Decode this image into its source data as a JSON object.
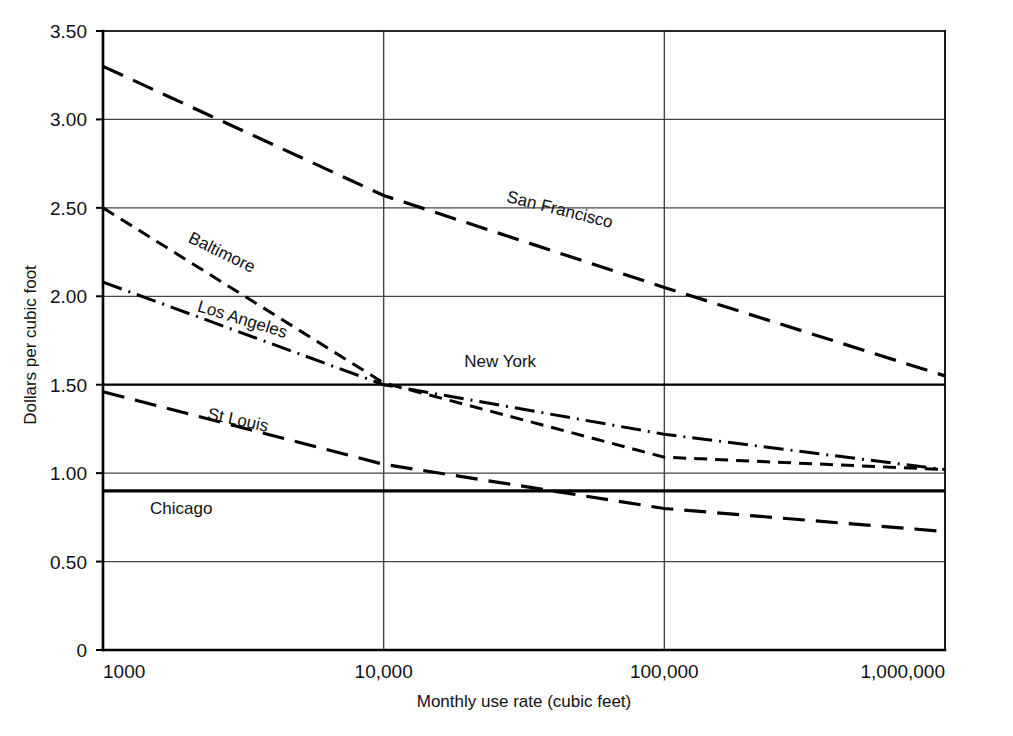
{
  "chart_data": {
    "type": "line",
    "title": "",
    "xlabel": "Monthly use rate (cubic feet)",
    "ylabel": "Dollars per cubic foot",
    "xscale": "log",
    "xlim": [
      1000,
      1000000
    ],
    "ylim": [
      0,
      3.5
    ],
    "grid": true,
    "legend_position": "inline-labels",
    "x_tick_labels": [
      "1000",
      "10,000",
      "100,000",
      "1,000,000"
    ],
    "x_tick_values": [
      1000,
      10000,
      100000,
      1000000
    ],
    "y_tick_labels": [
      "0",
      "0.50",
      "1.00",
      "1.50",
      "2.00",
      "2.50",
      "3.00",
      "3.50"
    ],
    "y_tick_values": [
      0,
      0.5,
      1.0,
      1.5,
      2.0,
      2.5,
      3.0,
      3.5
    ],
    "series": [
      {
        "name": "San Francisco",
        "style": "long-dash",
        "label_x": 42000,
        "label_y": 2.46,
        "label_rotation": 14,
        "points": [
          {
            "x": 1000,
            "y": 3.3
          },
          {
            "x": 10000,
            "y": 2.57
          },
          {
            "x": 100000,
            "y": 2.05
          },
          {
            "x": 1000000,
            "y": 1.55
          }
        ]
      },
      {
        "name": "Baltimore",
        "style": "dashed",
        "label_x": 2600,
        "label_y": 2.22,
        "label_rotation": 26,
        "points": [
          {
            "x": 1000,
            "y": 2.5
          },
          {
            "x": 10000,
            "y": 1.51
          },
          {
            "x": 100000,
            "y": 1.09
          },
          {
            "x": 1000000,
            "y": 1.02
          }
        ]
      },
      {
        "name": "Los Angeles",
        "style": "dash-dot",
        "label_x": 3100,
        "label_y": 1.84,
        "label_rotation": 17,
        "points": [
          {
            "x": 1000,
            "y": 2.08
          },
          {
            "x": 10000,
            "y": 1.5
          },
          {
            "x": 100000,
            "y": 1.22
          },
          {
            "x": 1000000,
            "y": 1.02
          }
        ]
      },
      {
        "name": "New York",
        "style": "solid",
        "label_x": 26000,
        "label_y": 1.6,
        "label_rotation": 0,
        "points": [
          {
            "x": 1000,
            "y": 1.5
          },
          {
            "x": 1000000,
            "y": 1.5
          }
        ]
      },
      {
        "name": "St Louis",
        "style": "long-dash",
        "label_x": 3000,
        "label_y": 1.27,
        "label_rotation": 12,
        "points": [
          {
            "x": 1000,
            "y": 1.46
          },
          {
            "x": 10000,
            "y": 1.05
          },
          {
            "x": 100000,
            "y": 0.8
          },
          {
            "x": 1000000,
            "y": 0.67
          }
        ]
      },
      {
        "name": "Chicago",
        "style": "solid-bold",
        "label_x": 1900,
        "label_y": 0.77,
        "label_rotation": 0,
        "points": [
          {
            "x": 1000,
            "y": 0.9
          },
          {
            "x": 1000000,
            "y": 0.9
          }
        ]
      }
    ]
  },
  "colors": {
    "line": "#000000",
    "grid": "#444444",
    "axis": "#000000",
    "background": "#ffffff"
  }
}
